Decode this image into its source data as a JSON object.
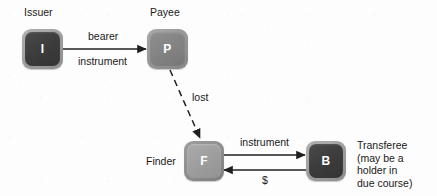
{
  "diagram": {
    "background_color": "#fdfdfd",
    "text_color": "#1a1a1a",
    "nodes": [
      {
        "id": "issuer",
        "glyph": "I",
        "caption": "Issuer",
        "style": "dark"
      },
      {
        "id": "payee",
        "glyph": "P",
        "caption": "Payee",
        "style": "mid"
      },
      {
        "id": "finder",
        "glyph": "F",
        "caption": "Finder",
        "style": "light"
      },
      {
        "id": "transferee",
        "glyph": "B",
        "caption": "Transferee\n(may be a\nholder in\ndue course)",
        "style": "dark"
      }
    ],
    "edges": [
      {
        "id": "issuer-to-payee",
        "from": "issuer",
        "to": "payee",
        "style": "solid",
        "label_above": "bearer",
        "label_below": "instrument"
      },
      {
        "id": "payee-to-finder",
        "from": "payee",
        "to": "finder",
        "style": "dashed",
        "label": "lost"
      },
      {
        "id": "finder-to-transferee",
        "from": "finder",
        "to": "transferee",
        "style": "solid",
        "label": "instrument"
      },
      {
        "id": "transferee-to-finder",
        "from": "transferee",
        "to": "finder",
        "style": "solid",
        "label": "$"
      }
    ]
  }
}
